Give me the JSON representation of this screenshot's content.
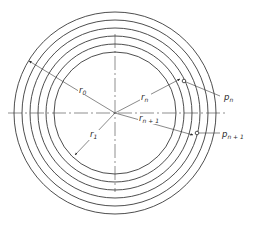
{
  "figure": {
    "type": "concentric-circles-diagram",
    "center": {
      "x": 115,
      "y": 113
    },
    "radii": [
      101,
      93,
      85,
      77,
      69,
      61
    ],
    "colors": {
      "stroke": "#3a3a3a",
      "background": "#ffffff"
    }
  },
  "labels": {
    "r0": {
      "base": "r",
      "sub": "0"
    },
    "r1": {
      "base": "r",
      "sub": "1"
    },
    "rn": {
      "base": "r",
      "sub": "n"
    },
    "rn1": {
      "base": "r",
      "sub": "n + 1"
    },
    "pn": {
      "base": "p",
      "sub": "n"
    },
    "pn1": {
      "base": "p",
      "sub": "n + 1"
    }
  }
}
